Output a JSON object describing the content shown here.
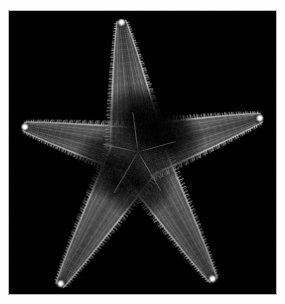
{
  "image": {
    "kind": "photograph",
    "subject": "starfish",
    "subject_long": "five-armed sea star, oral (underside) view",
    "background_color": "#000000",
    "page_background_color": "#ffffff",
    "frame_border_color": "#b9b9b9",
    "frame": {
      "x": 8,
      "y": 10,
      "width": 269,
      "height": 285
    },
    "canvas": {
      "width": 285,
      "height": 304
    }
  },
  "specimen": {
    "label": "starfish",
    "arm_count": 5,
    "body_color_mid": "#8d8d8d",
    "body_color_dark": "#2b2b2b",
    "spine_color": "#f2f2f2",
    "tip_plate_color": "#ffffff",
    "center": {
      "x": 138,
      "y": 152
    },
    "disc_radius": 34,
    "arms": [
      {
        "name": "arm-top",
        "tip": {
          "x": 121,
          "y": 18
        },
        "angle_deg": -97,
        "length": 136,
        "half_width_base": 30,
        "half_width_tip": 4,
        "tip_plate": true,
        "brightness": 0.95
      },
      {
        "name": "arm-right",
        "tip": {
          "x": 264,
          "y": 117
        },
        "angle_deg": -14,
        "length": 130,
        "half_width_base": 29,
        "half_width_tip": 4,
        "tip_plate": true,
        "brightness": 1.0
      },
      {
        "name": "arm-left",
        "tip": {
          "x": 21,
          "y": 126
        },
        "angle_deg": 190,
        "length": 120,
        "half_width_base": 26,
        "half_width_tip": 4,
        "tip_plate": true,
        "brightness": 0.88
      },
      {
        "name": "arm-lower-left",
        "tip": {
          "x": 58,
          "y": 288
        },
        "angle_deg": 118,
        "length": 152,
        "half_width_base": 29,
        "half_width_tip": 4,
        "tip_plate": true,
        "brightness": 0.92
      },
      {
        "name": "arm-lower-right",
        "tip": {
          "x": 215,
          "y": 283
        },
        "angle_deg": 62,
        "length": 144,
        "half_width_base": 28,
        "half_width_tip": 4,
        "tip_plate": true,
        "brightness": 0.9
      }
    ]
  },
  "caption": {
    "alt_text": "Photograph of a five-armed starfish on a black background"
  }
}
